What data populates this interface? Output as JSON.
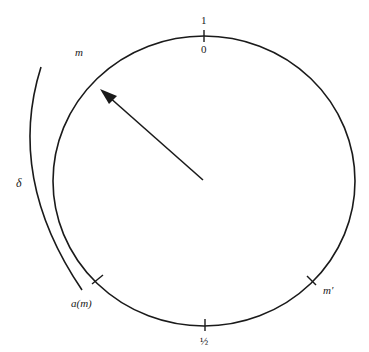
{
  "diagram": {
    "type": "circle-with-arc-and-pointer",
    "circle": {
      "cx": 204,
      "cy": 181,
      "rx": 151,
      "ry": 145,
      "stroke": "#1a1a1a"
    },
    "outer_arc": {
      "label_start": "m",
      "label_end": "a(m)",
      "label_length": "δ"
    },
    "pointer": {
      "from": [
        203,
        180
      ],
      "to": [
        101,
        90
      ]
    },
    "ticks": [
      {
        "name": "top",
        "label_above": "1",
        "label_below": "0"
      },
      {
        "name": "bottom",
        "label": "½"
      },
      {
        "name": "lower-left",
        "label": ""
      },
      {
        "name": "lower-right",
        "label": "m′"
      }
    ]
  },
  "labels": {
    "top_outer": "1",
    "top_inner": "0",
    "bottom": "½",
    "m": "m",
    "delta": "δ",
    "a_m": "a(m)",
    "m_prime": "m′"
  }
}
